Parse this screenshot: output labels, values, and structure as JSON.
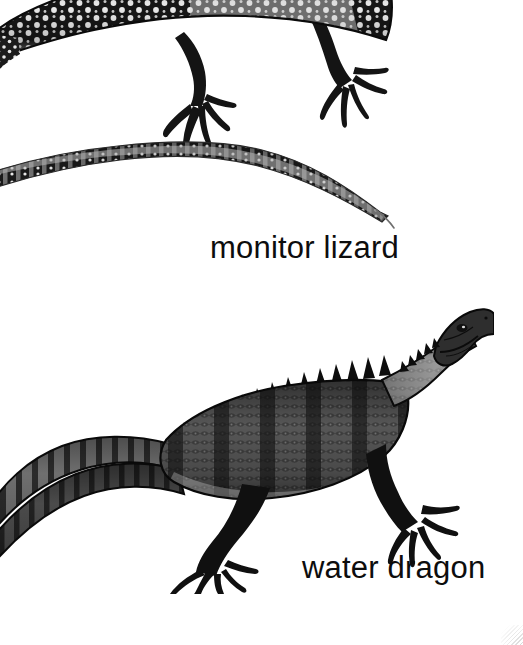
{
  "page": {
    "background_color": "#ffffff",
    "width": 523,
    "height": 645,
    "ink_color": "#0d0d0d"
  },
  "figures": [
    {
      "id": "monitor-lizard",
      "label": "monitor lizard",
      "subject": "monitor-lizard-illustration",
      "style": "black-and-white engraving",
      "description": "Dark spotted monitor lizard with pale ocelli, long banded tapering tail curving to the right; body cropped by the top edge of the frame.",
      "orientation": "body at top, tail sweeping down and right",
      "label_position": "below-right of tail"
    },
    {
      "id": "water-dragon",
      "label": "water dragon",
      "subject": "water-dragon-illustration",
      "style": "black-and-white engraving",
      "description": "Water dragon in profile facing upper right, spiny dorsal crest, banded flanks, broad laterally compressed tail extending to the left, four clawed limbs.",
      "orientation": "head upper right, tail lower left",
      "label_position": "below-right of body"
    }
  ],
  "artifacts": {
    "corner_smudge": "faint gray halftone wedge in bottom-right corner"
  }
}
